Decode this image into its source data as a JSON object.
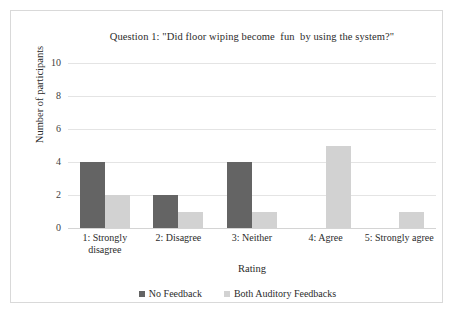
{
  "chart_data": {
    "type": "bar",
    "title": "Question 1: \"Did floor wiping become  fun  by using the system?\"",
    "xlabel": "Rating",
    "ylabel": "Number of participants",
    "categories": [
      "1: Strongly\ndisagree",
      "2: Disagree",
      "3: Neither",
      "4: Agree",
      "5: Strongly agree"
    ],
    "series": [
      {
        "name": "No Feedback",
        "color": "#646464",
        "values": [
          4,
          2,
          4,
          0,
          0
        ]
      },
      {
        "name": "Both Auditory Feedbacks",
        "color": "#d2d2d2",
        "values": [
          2,
          1,
          1,
          5,
          1
        ]
      }
    ],
    "ylim": [
      0,
      10
    ],
    "yticks": [
      0,
      2,
      4,
      6,
      8,
      10
    ],
    "ytick_labels": [
      "0",
      "2",
      "4",
      "6",
      "8",
      "10"
    ],
    "grid": true,
    "legend_position": "bottom",
    "background": "#ffffff",
    "border_color": "#d9d9d9",
    "gridline_color": "#e4e4e4"
  }
}
